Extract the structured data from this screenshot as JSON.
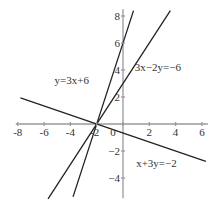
{
  "chart_data": {
    "type": "line",
    "title": "",
    "xlabel": "",
    "ylabel": "",
    "xlim": [
      -8,
      6.3
    ],
    "ylim": [
      -5.5,
      8.5
    ],
    "x_ticks": [
      -8,
      -6,
      -4,
      -2,
      0,
      2,
      4,
      6
    ],
    "y_ticks": [
      8,
      6,
      4,
      2,
      -2,
      -4
    ],
    "x_tick_labels": [
      "-8",
      "-6",
      "-4",
      "-2",
      "0",
      "2",
      "4",
      "6"
    ],
    "y_tick_labels": [
      "8",
      "6",
      "4",
      "2",
      "−2",
      "−4"
    ],
    "grid": false,
    "series": [
      {
        "name": "y=3x+6",
        "equation": "y=3x+6",
        "x": [
          -3.8,
          0.8
        ],
        "y": [
          -5.4,
          8.4
        ]
      },
      {
        "name": "3x-2y=-6",
        "equation": "3x−2y=−6",
        "x": [
          -5.7,
          3.6
        ],
        "y": [
          -5.55,
          8.4
        ]
      },
      {
        "name": "x+3y=-2",
        "equation": "x+3y=−2",
        "x": [
          -7.8,
          6.3
        ],
        "y": [
          1.93,
          -2.77
        ]
      }
    ],
    "annotations": [
      {
        "text": "y=3x+6",
        "x": -5.2,
        "y": 3.0
      },
      {
        "text": "3x−2y=−6",
        "x": 0.9,
        "y": 3.9
      },
      {
        "text": "x+3y=−2",
        "x": 1.0,
        "y": -3.2
      }
    ],
    "intersection": {
      "x": -2,
      "y": 0
    }
  }
}
